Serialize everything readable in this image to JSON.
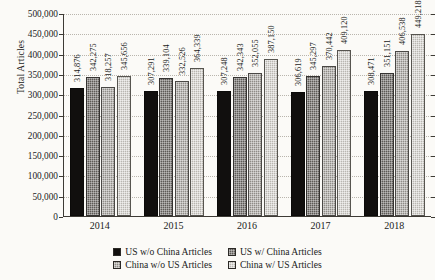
{
  "chart_data": {
    "type": "bar",
    "title": "",
    "xlabel": "",
    "ylabel": "Total Articles",
    "categories": [
      "2014",
      "2015",
      "2016",
      "2017",
      "2018"
    ],
    "ylim": [
      0,
      500000
    ],
    "ytick_step": 50000,
    "ytick_labels": [
      "500,000",
      "450,000",
      "400,000",
      "350,000",
      "300,000",
      "250,000",
      "200,000",
      "150,000",
      "100,000",
      "50,000",
      "0"
    ],
    "ytick_values": [
      500000,
      450000,
      400000,
      350000,
      300000,
      250000,
      200000,
      150000,
      100000,
      50000,
      0
    ],
    "grid": true,
    "legend_position": "bottom",
    "series": [
      {
        "name": "US w/o China Articles",
        "color": "#110f0e",
        "values": [
          314876,
          307291,
          307248,
          306619,
          308471
        ],
        "labels": [
          "314,876",
          "307,291",
          "307,248",
          "306,619",
          "308,471"
        ]
      },
      {
        "name": "US w/ China Articles",
        "color": "#5d5a56",
        "values": [
          342275,
          339104,
          342343,
          345297,
          351151
        ],
        "labels": [
          "342,275",
          "339,104",
          "342,343",
          "345,297",
          "351,151"
        ]
      },
      {
        "name": "China w/o US Articles",
        "color": "#8f8c87",
        "values": [
          318257,
          332526,
          352055,
          370442,
          406538
        ],
        "labels": [
          "318,257",
          "332,526",
          "352,055",
          "370,442",
          "406,538"
        ]
      },
      {
        "name": "China w/ US Articles",
        "color": "#b9b6b0",
        "values": [
          345656,
          364339,
          387150,
          409120,
          449218
        ],
        "labels": [
          "345,656",
          "364,339",
          "387,150",
          "409,120",
          "449,218"
        ]
      }
    ]
  }
}
